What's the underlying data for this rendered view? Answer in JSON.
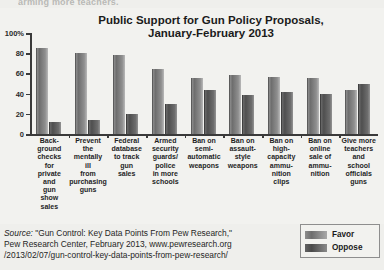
{
  "top_cut_text": "arming more teachers.",
  "source": {
    "label": "Source:",
    "line1": " \"Gun Control: Key Data Points From Pew Research,\"",
    "line2": "Pew Research Center, February 2013, www.pewresearch.org",
    "line3": "/2013/02/07/gun-control-key-data-points-from-pew-research/"
  },
  "legend": {
    "favor_label": "Favor",
    "oppose_label": "Oppose",
    "favor_color": "#8d8d8d",
    "oppose_color": "#4f4f4f"
  },
  "chart_data": {
    "type": "bar",
    "title": "Public Support for Gun Policy Proposals, January-February 2013",
    "title_line1": "Public Support for Gun Policy Proposals,",
    "title_line2": "January-February 2013",
    "xlabel": "",
    "ylabel": "",
    "ylim": [
      0,
      100
    ],
    "grid": false,
    "legend_position": "bottom-right",
    "ytick_labels": [
      "100%",
      "80",
      "60",
      "40",
      "20",
      "0"
    ],
    "ytick_values": [
      100,
      80,
      60,
      40,
      20,
      0
    ],
    "categories": [
      "Back-ground checks for private and gun show sales",
      "Prevent the mentally ill from purchasing guns",
      "Federal database to track gun sales",
      "Armed security guards/ police in more schools",
      "Ban on semi-automatic weapons",
      "Ban on assault-style weapons",
      "Ban on high-capacity ammu-nition clips",
      "Ban on online sale of ammu-nition",
      "Give more teachers and school officials guns"
    ],
    "category_lines": [
      [
        "Back-",
        "ground",
        "checks",
        "for",
        "private",
        "and",
        "gun",
        "show",
        "sales"
      ],
      [
        "Prevent",
        "the",
        "mentally",
        "ill",
        "from",
        "purchasing",
        "guns"
      ],
      [
        "Federal",
        "database",
        "to track",
        "gun",
        "sales"
      ],
      [
        "Armed",
        "security",
        "guards/",
        "police",
        "in more",
        "schools"
      ],
      [
        "Ban on",
        "semi-",
        "automatic",
        "weapons"
      ],
      [
        "Ban on",
        "assault-",
        "style",
        "weapons"
      ],
      [
        "Ban on",
        "high-",
        "capacity",
        "ammu-",
        "nition",
        "clips"
      ],
      [
        "Ban on",
        "online",
        "sale of",
        "ammu-",
        "nition"
      ],
      [
        "Give more",
        "teachers",
        "and",
        "school",
        "officials",
        "guns"
      ]
    ],
    "series": [
      {
        "name": "Favor",
        "values": [
          85,
          80,
          78,
          64,
          55,
          58,
          56,
          55,
          44
        ]
      },
      {
        "name": "Oppose",
        "values": [
          12,
          14,
          20,
          30,
          44,
          39,
          42,
          40,
          50
        ]
      }
    ]
  }
}
